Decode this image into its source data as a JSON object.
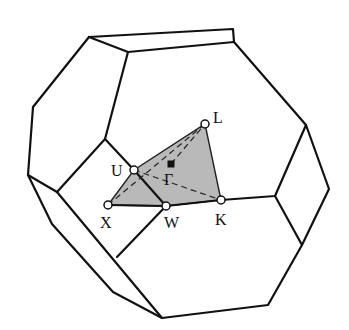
{
  "figure": {
    "colors": {
      "edge": "#111111",
      "face_fill": "#b9b9b9",
      "background": "#ffffff"
    },
    "points": [
      {
        "id": "L",
        "label": "L",
        "x": 205,
        "y": 124
      },
      {
        "id": "U",
        "label": "U",
        "x": 134,
        "y": 170
      },
      {
        "id": "Gamma",
        "label": "Γ",
        "x": 171,
        "y": 164
      },
      {
        "id": "X",
        "label": "X",
        "x": 108,
        "y": 205
      },
      {
        "id": "W",
        "label": "W",
        "x": 166,
        "y": 206
      },
      {
        "id": "K",
        "label": "K",
        "x": 221,
        "y": 200
      }
    ]
  }
}
